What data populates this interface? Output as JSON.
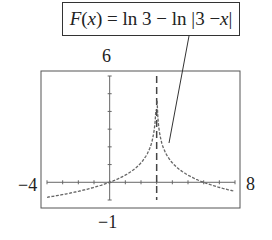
{
  "chart_data": {
    "type": "line",
    "title": "F(x) = ln 3 − ln |3 − x|",
    "function": "F(x) = ln 3 - ln|3 - x|",
    "xlim": [
      -4,
      8
    ],
    "ylim": [
      -1,
      6
    ],
    "xlabel": "",
    "ylabel": "",
    "axis_labels": {
      "xmin": "−4",
      "xmax": "8",
      "ymin": "−1",
      "ymax": "6"
    },
    "asymptote": {
      "type": "vertical",
      "x": 3,
      "style": "dashed"
    },
    "grid": false,
    "x_ticks": [
      -4,
      -3,
      -2,
      -1,
      0,
      1,
      2,
      3,
      4,
      5,
      6,
      7,
      8
    ],
    "y_ticks": [
      -1,
      0,
      1,
      2,
      3,
      4,
      5,
      6
    ],
    "series": [
      {
        "name": "F(x)",
        "x": [
          -4,
          -3,
          -2,
          -1,
          0,
          1,
          2,
          2.5,
          2.8,
          2.9,
          3.1,
          3.2,
          3.5,
          4,
          5,
          6,
          7,
          8
        ],
        "values": [
          -0.847,
          -0.693,
          -0.511,
          -0.288,
          0,
          0.405,
          1.099,
          1.792,
          2.708,
          3.401,
          3.401,
          2.708,
          1.792,
          1.099,
          0.405,
          0,
          -0.288,
          -0.511
        ]
      }
    ]
  },
  "labels": {
    "formula_prefix": "F(",
    "formula_var": "x",
    "formula_suffix": ") = ln 3 − ln |3 − ",
    "formula_var2": "x",
    "formula_end": "|",
    "ymax": "6",
    "ymin": "−1",
    "xmin": "−4",
    "xmax": "8"
  }
}
